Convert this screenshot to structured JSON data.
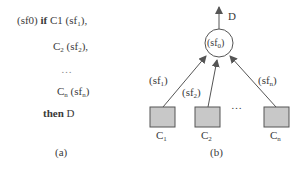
{
  "panel_a": {
    "line1": {
      "prefix": "(sf0) ",
      "keyword": "if",
      "cond": " C1 (sf",
      "sub": "1",
      "suffix": "),"
    },
    "line2": {
      "cond": "C",
      "cond_sub": "2",
      "mid": " (sf",
      "sub": "2",
      "suffix": "),"
    },
    "ellipsis": "…",
    "line3": {
      "cond": "C",
      "cond_sub": "n",
      "mid": " (sf",
      "sub": "n",
      "suffix": ")"
    },
    "line4": {
      "keyword": "then",
      "conclusion": " D"
    },
    "caption": "(a)"
  },
  "panel_b": {
    "output_label": "D",
    "node_label": "(sf",
    "node_sub": "0",
    "node_suffix": ")",
    "edges": [
      {
        "label": "(sf",
        "sub": "1",
        "suffix": ")"
      },
      {
        "label": "(sf",
        "sub": "2",
        "suffix": ")"
      },
      {
        "label": "(sf",
        "sub": "n",
        "suffix": ")"
      }
    ],
    "ellipsis": "…",
    "inputs": [
      {
        "label": "C",
        "sub": "1"
      },
      {
        "label": "C",
        "sub": "2"
      },
      {
        "label": "C",
        "sub": "n"
      }
    ],
    "caption": "(b)",
    "colors": {
      "box_fill": "#c8c8c8",
      "stroke": "#555555"
    }
  }
}
